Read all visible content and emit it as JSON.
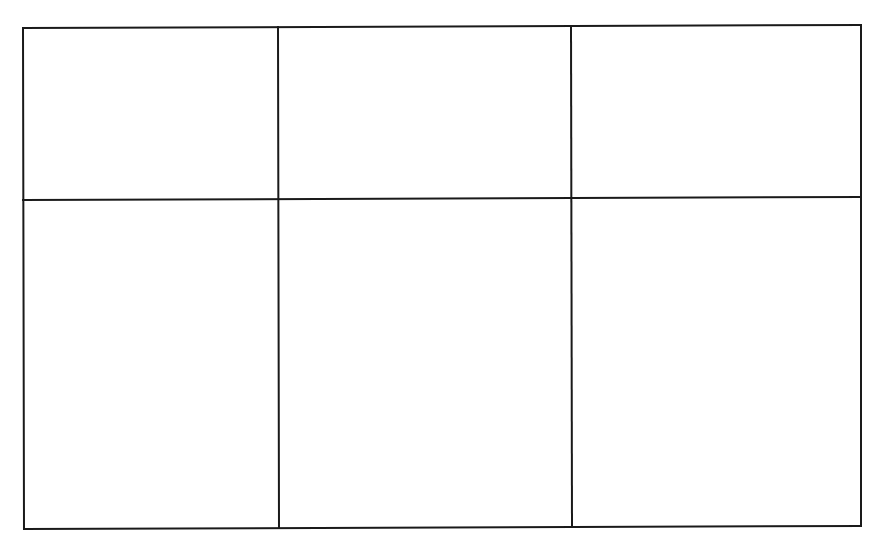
{
  "diagram": {
    "type": "empty-grid",
    "rows": 2,
    "columns": 3,
    "line_color": "#1a1a1a",
    "background_color": "#ffffff",
    "line_width": 2,
    "cells": [
      {
        "row": 0,
        "col": 0,
        "text": ""
      },
      {
        "row": 0,
        "col": 1,
        "text": ""
      },
      {
        "row": 0,
        "col": 2,
        "text": ""
      },
      {
        "row": 1,
        "col": 0,
        "text": ""
      },
      {
        "row": 1,
        "col": 1,
        "text": ""
      },
      {
        "row": 1,
        "col": 2,
        "text": ""
      }
    ]
  }
}
